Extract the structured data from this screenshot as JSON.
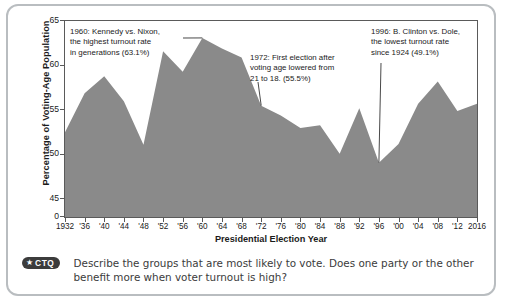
{
  "chart_data": {
    "type": "area",
    "title": "",
    "xlabel": "Presidential Election Year",
    "ylabel": "Percentage of Voting-Age Population",
    "ylim": [
      43,
      65
    ],
    "y_ticks": [
      "65",
      "60",
      "55",
      "50",
      "45",
      "0"
    ],
    "y_tick_values": [
      65,
      60,
      55,
      50,
      45,
      43
    ],
    "grid": false,
    "legend": "none",
    "x": [
      1932,
      1936,
      1940,
      1944,
      1948,
      1952,
      1956,
      1960,
      1964,
      1968,
      1972,
      1976,
      1980,
      1984,
      1988,
      1992,
      1996,
      2000,
      2004,
      2008,
      2012,
      2016
    ],
    "categories": [
      "1932",
      "'36",
      "'40",
      "'44",
      "'48",
      "'52",
      "'56",
      "'60",
      "'64",
      "'68",
      "'72",
      "'76",
      "'80",
      "'84",
      "'88",
      "'92",
      "'96",
      "'00",
      "'04",
      "'08",
      "'12",
      "2016"
    ],
    "values": [
      52.5,
      56.9,
      58.8,
      56.0,
      51.1,
      61.6,
      59.3,
      63.1,
      61.9,
      60.9,
      55.5,
      54.4,
      53.0,
      53.3,
      50.1,
      55.2,
      49.1,
      51.2,
      55.7,
      58.2,
      54.9,
      55.7
    ],
    "annotations": [
      {
        "id": "1960",
        "text": "1960: Kennedy vs. Nixon,\nthe highest turnout rate\nin generations (63.1%)",
        "points_to_year": 1960,
        "points_to_value": 63.1
      },
      {
        "id": "1972",
        "text": "1972: First election after\nvoting age lowered from\n21 to 18. (55.5%)",
        "points_to_year": 1972,
        "points_to_value": 55.5
      },
      {
        "id": "1996",
        "text": "1996: B. Clinton vs. Dole,\nthe lowest turnout rate\nsince 1924 (49.1%)",
        "points_to_year": 1996,
        "points_to_value": 49.1
      }
    ],
    "colors": {
      "area_fill": "#8a8a8a",
      "axis": "#5a5a5a",
      "text": "#1b1b1b",
      "card_border": "#b9bdc0"
    }
  },
  "footer": {
    "badge_star": "★",
    "badge_label": "CTQ",
    "question": "Describe the groups that are most likely to vote. Does one party or the other benefit more when voter turnout is high?"
  }
}
